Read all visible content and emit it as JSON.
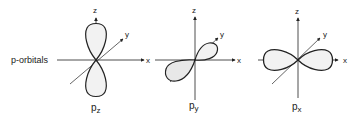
{
  "diagram": {
    "row_label": "p-orbitals",
    "orbitals": [
      {
        "name": "pz",
        "label_main": "p",
        "label_sub": "z",
        "axes": {
          "x": "x",
          "y": "y",
          "z": "z"
        },
        "lobe_axis": "z"
      },
      {
        "name": "py",
        "label_main": "p",
        "label_sub": "y",
        "axes": {
          "x": "x",
          "y": "y",
          "z": "z"
        },
        "lobe_axis": "y"
      },
      {
        "name": "px",
        "label_main": "p",
        "label_sub": "x",
        "axes": {
          "x": "x",
          "y": "y",
          "z": "z"
        },
        "lobe_axis": "x"
      }
    ],
    "colors": {
      "line": "#222222",
      "lobe_fill": "#f2f2f2"
    }
  }
}
